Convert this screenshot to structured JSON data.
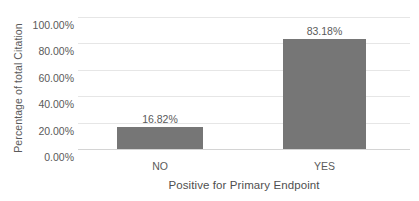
{
  "chart_data": {
    "type": "bar",
    "title": "",
    "subtitle": "",
    "xlabel": "Positive for Primary Endpoint",
    "ylabel": "Percentage of total Citation",
    "categories": [
      "NO",
      "YES"
    ],
    "values": [
      16.82,
      83.18
    ],
    "data_labels": [
      "16.82%",
      "83.18%"
    ],
    "ylim": [
      0,
      100
    ],
    "ytick_values": [
      0,
      20,
      40,
      60,
      80,
      100
    ],
    "ytick_labels": [
      "0.00%",
      "20.00%",
      "40.00%",
      "60.00%",
      "80.00%",
      "100.00%"
    ],
    "grid": true,
    "grid_axis": "y",
    "legend": false,
    "legend_position": "none",
    "series": [
      {
        "name": "Percentage of total Citation",
        "values": [
          16.82,
          83.18
        ],
        "color": "#767676"
      }
    ],
    "colors": {
      "bar": "#767676",
      "gridline": "#e6e6e6",
      "baseline": "#d4d4d4",
      "text": "#5a5a5a",
      "background": "#ffffff"
    }
  }
}
